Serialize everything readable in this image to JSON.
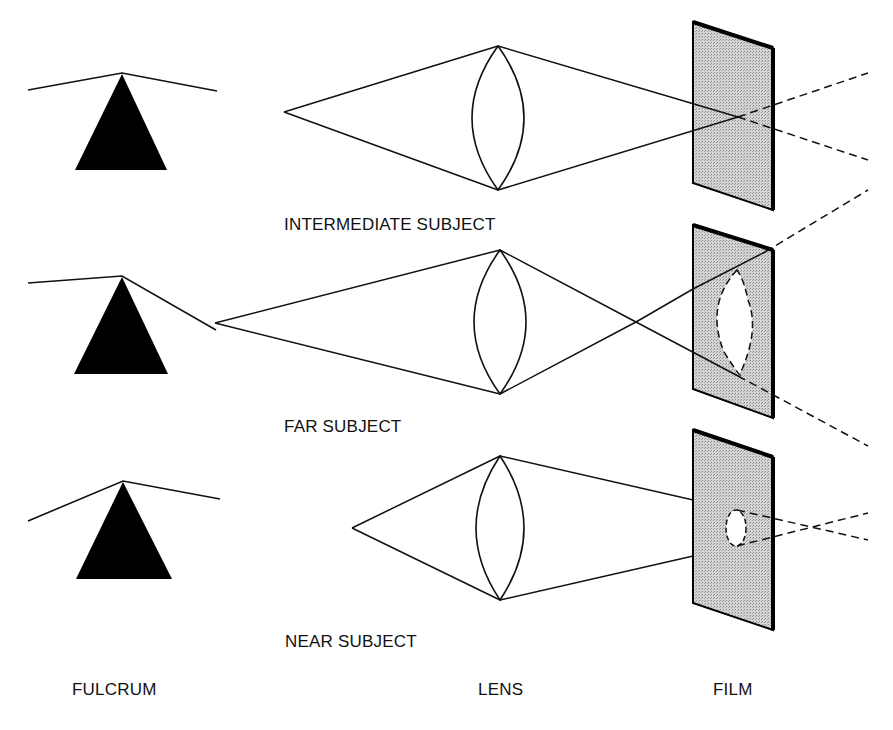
{
  "rows": [
    {
      "id": "intermediate",
      "label": "INTERMEDIATE SUBJECT"
    },
    {
      "id": "far",
      "label": "FAR SUBJECT"
    },
    {
      "id": "near",
      "label": "NEAR SUBJECT"
    }
  ],
  "columns": {
    "fulcrum": "FULCRUM",
    "lens": "LENS",
    "film": "FILM"
  },
  "colors": {
    "ink": "#111111",
    "film_fill": "#c8c8c8",
    "background": "#ffffff"
  }
}
